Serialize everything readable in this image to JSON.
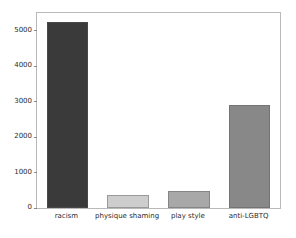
{
  "chart_data": {
    "type": "bar",
    "title": "",
    "xlabel": "",
    "ylabel": "",
    "categories": [
      "racism",
      "physique shaming",
      "play style",
      "anti-LGBTQ"
    ],
    "values": [
      5250,
      380,
      490,
      2900
    ],
    "ylim": [
      0,
      5500
    ],
    "yticks": [
      0,
      1000,
      2000,
      3000,
      4000,
      5000
    ],
    "ytick_labels": [
      "0",
      "1000",
      "2000",
      "3000",
      "4000",
      "5000"
    ],
    "xticks": [
      0,
      1,
      2,
      3
    ],
    "grid": false,
    "legend": null,
    "bar_colors": [
      "#3a3a3a",
      "#cdcdcd",
      "#a8a8a8",
      "#888888"
    ],
    "frame_color": "#b9b9b9",
    "background_color": "#ffffff",
    "text_color": "#2b2b2b"
  }
}
